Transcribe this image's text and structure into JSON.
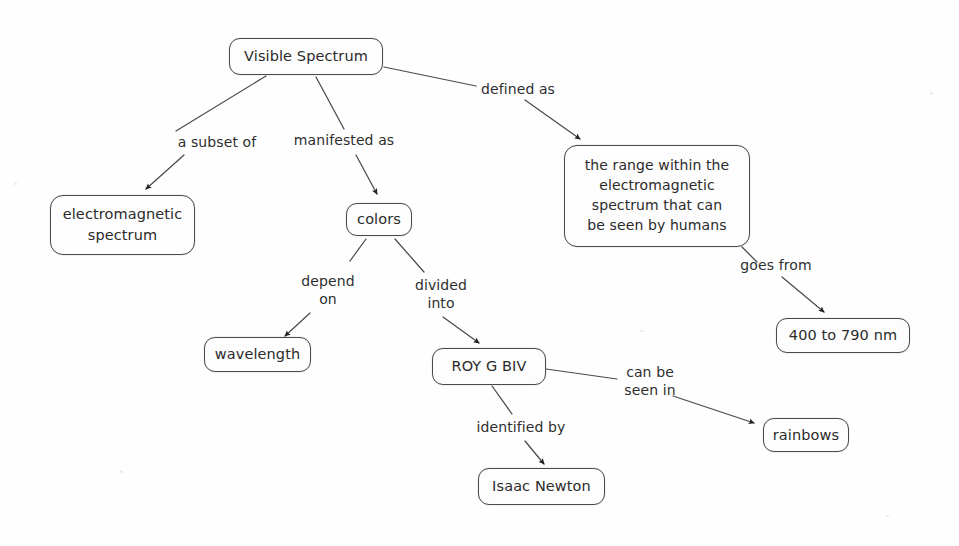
{
  "diagram": {
    "stroke_color": "#4a4a4a",
    "text_color": "#2b2b2b",
    "background_color": "#fefefe",
    "nodes": [
      {
        "id": "visible-spectrum",
        "label": "Visible Spectrum"
      },
      {
        "id": "electromagnetic-spectrum",
        "label": "electromagnetic\nspectrum"
      },
      {
        "id": "colors",
        "label": "colors"
      },
      {
        "id": "definition",
        "label": "the range within the\nelectromagnetic\nspectrum that can\nbe seen by humans"
      },
      {
        "id": "range",
        "label": "400 to 790 nm"
      },
      {
        "id": "wavelength",
        "label": "wavelength"
      },
      {
        "id": "roy-g-biv",
        "label": "ROY G BIV"
      },
      {
        "id": "isaac-newton",
        "label": "Isaac Newton"
      },
      {
        "id": "rainbows",
        "label": "rainbows"
      }
    ],
    "edge_labels": [
      {
        "id": "a-subset-of",
        "label": "a subset of"
      },
      {
        "id": "manifested-as",
        "label": "manifested as"
      },
      {
        "id": "defined-as",
        "label": "defined as"
      },
      {
        "id": "goes-from",
        "label": "goes from"
      },
      {
        "id": "depend-on",
        "label": "depend\non"
      },
      {
        "id": "divided-into",
        "label": "divided\ninto"
      },
      {
        "id": "identified-by",
        "label": "identified by"
      },
      {
        "id": "can-be-seen-in",
        "label": "can be\nseen in"
      }
    ]
  }
}
